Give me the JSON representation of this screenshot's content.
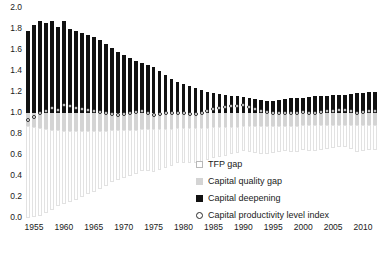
{
  "chart_data": {
    "type": "bar",
    "stacked": true,
    "title": "",
    "xlabel": "",
    "ylabel": "",
    "ylim": [
      0.0,
      2.0
    ],
    "ytick_step": 0.2,
    "yticks": [
      "0.0",
      "0.2",
      "0.4",
      "0.6",
      "0.8",
      "1.0",
      "1.2",
      "1.4",
      "1.6",
      "1.8",
      "2.0"
    ],
    "grid": false,
    "legend_position": "bottom-right",
    "x": [
      1954,
      1955,
      1956,
      1957,
      1958,
      1959,
      1960,
      1961,
      1962,
      1963,
      1964,
      1965,
      1966,
      1967,
      1968,
      1969,
      1970,
      1971,
      1972,
      1973,
      1974,
      1975,
      1976,
      1977,
      1978,
      1979,
      1980,
      1981,
      1982,
      1983,
      1984,
      1985,
      1986,
      1987,
      1988,
      1989,
      1990,
      1991,
      1992,
      1993,
      1994,
      1995,
      1996,
      1997,
      1998,
      1999,
      2000,
      2001,
      2002,
      2003,
      2004,
      2005,
      2006,
      2007,
      2008,
      2009,
      2010,
      2011,
      2012
    ],
    "xtick_labels": [
      "1955",
      "1960",
      "1965",
      "1970",
      "1975",
      "1980",
      "1985",
      "1990",
      "1995",
      "2000",
      "2005",
      "2010"
    ],
    "xtick_values": [
      1955,
      1960,
      1965,
      1970,
      1975,
      1980,
      1985,
      1990,
      1995,
      2000,
      2005,
      2010
    ],
    "series": [
      {
        "name": "TFP gap",
        "color": "#ffffff",
        "stack_from": 1.0,
        "direction": "down",
        "values": [
          0.88,
          0.86,
          0.84,
          0.8,
          0.76,
          0.73,
          0.7,
          0.68,
          0.66,
          0.63,
          0.6,
          0.58,
          0.55,
          0.53,
          0.5,
          0.48,
          0.46,
          0.44,
          0.42,
          0.4,
          0.4,
          0.41,
          0.39,
          0.37,
          0.35,
          0.34,
          0.34,
          0.34,
          0.34,
          0.33,
          0.31,
          0.3,
          0.29,
          0.28,
          0.26,
          0.25,
          0.24,
          0.25,
          0.26,
          0.27,
          0.27,
          0.26,
          0.25,
          0.24,
          0.25,
          0.25,
          0.24,
          0.25,
          0.25,
          0.24,
          0.23,
          0.22,
          0.21,
          0.21,
          0.23,
          0.26,
          0.25,
          0.24,
          0.24
        ]
      },
      {
        "name": "Capital quality gap",
        "color": "#d4d4d4",
        "stack_from": 1.0,
        "direction": "down",
        "values": [
          0.12,
          0.13,
          0.14,
          0.15,
          0.16,
          0.16,
          0.17,
          0.17,
          0.17,
          0.17,
          0.17,
          0.17,
          0.17,
          0.17,
          0.16,
          0.16,
          0.16,
          0.16,
          0.16,
          0.15,
          0.15,
          0.15,
          0.15,
          0.15,
          0.15,
          0.14,
          0.14,
          0.14,
          0.14,
          0.14,
          0.14,
          0.13,
          0.13,
          0.13,
          0.13,
          0.13,
          0.12,
          0.12,
          0.12,
          0.12,
          0.12,
          0.12,
          0.12,
          0.12,
          0.12,
          0.12,
          0.11,
          0.11,
          0.11,
          0.11,
          0.11,
          0.11,
          0.11,
          0.11,
          0.11,
          0.11,
          0.11,
          0.11,
          0.11
        ]
      },
      {
        "name": "Capital deepening",
        "color": "#111111",
        "stack_from": 1.0,
        "direction": "up",
        "values": [
          0.78,
          0.84,
          0.88,
          0.86,
          0.88,
          0.82,
          0.88,
          0.8,
          0.78,
          0.76,
          0.74,
          0.72,
          0.7,
          0.66,
          0.62,
          0.58,
          0.55,
          0.52,
          0.5,
          0.48,
          0.46,
          0.44,
          0.4,
          0.36,
          0.32,
          0.3,
          0.28,
          0.26,
          0.24,
          0.22,
          0.2,
          0.19,
          0.18,
          0.17,
          0.16,
          0.16,
          0.15,
          0.14,
          0.13,
          0.12,
          0.11,
          0.11,
          0.12,
          0.13,
          0.14,
          0.14,
          0.14,
          0.15,
          0.16,
          0.16,
          0.16,
          0.17,
          0.17,
          0.17,
          0.18,
          0.19,
          0.19,
          0.2,
          0.2
        ]
      }
    ],
    "marker_series": {
      "name": "Capital productivity level index",
      "marker": "open-circle",
      "color": "#ffffff",
      "edge_color": "#2a2a2a",
      "values": [
        0.93,
        0.96,
        1.0,
        1.02,
        1.05,
        1.03,
        1.08,
        1.07,
        1.05,
        1.04,
        1.03,
        1.02,
        1.01,
        1.0,
        0.99,
        0.98,
        0.99,
        1.0,
        1.01,
        1.02,
        1.0,
        0.98,
        0.99,
        1.0,
        1.0,
        1.0,
        1.0,
        0.99,
        0.99,
        1.0,
        1.02,
        1.04,
        1.05,
        1.06,
        1.07,
        1.07,
        1.08,
        1.06,
        1.04,
        1.02,
        1.01,
        1.0,
        1.0,
        1.0,
        1.0,
        1.0,
        1.01,
        1.0,
        1.0,
        1.01,
        1.02,
        1.02,
        1.03,
        1.03,
        1.02,
        1.0,
        1.01,
        1.02,
        1.02
      ]
    },
    "legend_entries": [
      {
        "label": "TFP gap",
        "swatch": "tfp"
      },
      {
        "label": "Capital quality gap",
        "swatch": "qual"
      },
      {
        "label": "Capital deepening",
        "swatch": "deep"
      },
      {
        "label": "Capital productivity level index",
        "swatch": "circle"
      }
    ]
  }
}
